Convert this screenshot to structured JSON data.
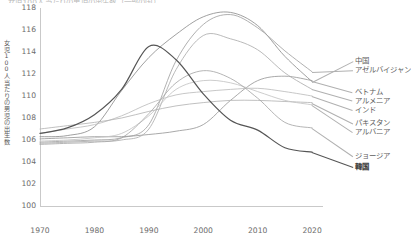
{
  "chart": {
    "title_clipped": "女児100人当たりの男児の出生数（一部の国）",
    "ylabel_chars": [
      "女",
      "児",
      "1",
      "0",
      "0",
      "人",
      "当",
      "た",
      "り",
      "の",
      "男",
      "児",
      "の",
      "出",
      "生",
      "数"
    ],
    "yticks": [
      "118",
      "116",
      "114",
      "112",
      "110",
      "108",
      "106",
      "104",
      "102",
      "100"
    ],
    "xticks": [
      "1970",
      "1980",
      "1990",
      "2000",
      "2010",
      "2020"
    ]
  },
  "legend": {
    "items": [
      {
        "label": "中国",
        "bold": false
      },
      {
        "label": "アゼルバイジャン",
        "bold": false
      },
      {
        "label": "ベトナム",
        "bold": false
      },
      {
        "label": "アルメニア",
        "bold": false
      },
      {
        "label": "インド",
        "bold": false
      },
      {
        "label": "パキスタン",
        "bold": false
      },
      {
        "label": "アルバニア",
        "bold": false
      },
      {
        "label": "ジョージア",
        "bold": false
      },
      {
        "label": "韓国",
        "bold": true
      }
    ]
  },
  "chart_data": {
    "type": "line",
    "title": "女児100人当たりの男児の出生数（一部の国）",
    "xlabel": "",
    "ylabel": "女児100人当たりの男児の出生数",
    "xlim": [
      1970,
      2022
    ],
    "ylim": [
      100,
      118
    ],
    "ytick_values": [
      100,
      102,
      104,
      106,
      108,
      110,
      112,
      114,
      116,
      118
    ],
    "xtick_values": [
      1970,
      1980,
      1990,
      2000,
      2010,
      2020
    ],
    "grid": false,
    "legend_position": "right",
    "x": [
      1970,
      1975,
      1980,
      1985,
      1990,
      1995,
      2000,
      2005,
      2010,
      2015,
      2020
    ],
    "series": [
      {
        "name": "中国",
        "color": "#8f8f8f",
        "values": [
          106.3,
          106.4,
          107.2,
          110.5,
          113.5,
          115.6,
          117.2,
          117.6,
          116.4,
          113.6,
          111.3
        ]
      },
      {
        "name": "アゼルバイジャン",
        "color": "#a2a2a2",
        "values": [
          105.8,
          105.9,
          106.0,
          106.2,
          107.4,
          113.2,
          116.5,
          117.4,
          116.2,
          114.1,
          112.2
        ]
      },
      {
        "name": "ベトナム",
        "color": "#9a9a9a",
        "values": [
          106.1,
          106.2,
          106.3,
          106.3,
          106.5,
          106.8,
          107.4,
          109.6,
          111.4,
          111.8,
          111.4
        ]
      },
      {
        "name": "アルメニア",
        "color": "#adadad",
        "values": [
          105.7,
          105.8,
          105.9,
          106.0,
          107.0,
          112.4,
          115.5,
          115.2,
          114.2,
          112.1,
          110.6
        ]
      },
      {
        "name": "インド",
        "color": "#bdbdbd",
        "values": [
          106.6,
          107.0,
          107.4,
          108.2,
          109.3,
          110.1,
          110.4,
          110.6,
          110.7,
          110.4,
          110.0
        ]
      },
      {
        "name": "パキスタン",
        "color": "#b5b5b5",
        "values": [
          107.0,
          107.3,
          107.6,
          108.0,
          108.6,
          109.1,
          109.4,
          109.6,
          109.6,
          109.5,
          109.4
        ]
      },
      {
        "name": "アルバニア",
        "color": "#c4c4c4",
        "values": [
          105.9,
          106.0,
          106.2,
          106.6,
          108.2,
          110.6,
          111.4,
          111.2,
          110.4,
          109.6,
          109.2
        ]
      },
      {
        "name": "ジョージア",
        "color": "#a8a8a8",
        "values": [
          105.6,
          105.7,
          105.8,
          106.2,
          108.4,
          111.2,
          112.3,
          111.6,
          109.8,
          107.6,
          107.1
        ]
      },
      {
        "name": "韓国",
        "color": "#555555",
        "values": [
          106.6,
          107.1,
          108.3,
          110.6,
          114.5,
          113.3,
          110.2,
          107.8,
          106.9,
          105.3,
          104.9
        ]
      }
    ]
  }
}
